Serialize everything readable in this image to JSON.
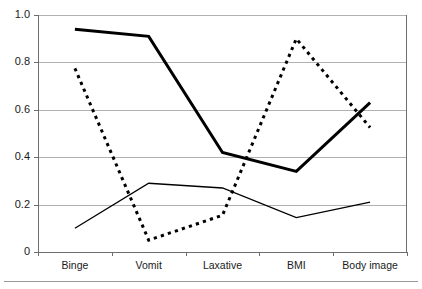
{
  "chart_data": {
    "type": "line",
    "title": "",
    "subtitle": "",
    "xlabel": "",
    "ylabel": "",
    "categories": [
      "Binge",
      "Vomit",
      "Laxative",
      "BMI",
      "Body image"
    ],
    "ylim": [
      0,
      1.0
    ],
    "ytick_labels": [
      "0",
      "0.2",
      "0.4",
      "0.6",
      "0.8",
      "1.0"
    ],
    "ytick_values": [
      0,
      0.2,
      0.4,
      0.6,
      0.8,
      1.0
    ],
    "grid": true,
    "grid_axis": "y",
    "legend": false,
    "legend_position": "none",
    "annotations": [],
    "series": [
      {
        "name": "thick-solid-series",
        "style": "solid",
        "line_width": 3,
        "color": "#000000",
        "values": [
          0.94,
          0.91,
          0.42,
          0.34,
          0.63
        ]
      },
      {
        "name": "thin-solid-series",
        "style": "solid",
        "line_width": 1.3,
        "color": "#000000",
        "values": [
          0.1,
          0.29,
          0.27,
          0.145,
          0.21
        ]
      },
      {
        "name": "dotted-series",
        "style": "dotted",
        "line_width": 3,
        "color": "#000000",
        "values": [
          0.775,
          0.05,
          0.155,
          0.9,
          0.525
        ]
      }
    ]
  },
  "axes": {
    "y_axis_name": "y-axis",
    "x_axis_name": "x-axis"
  }
}
